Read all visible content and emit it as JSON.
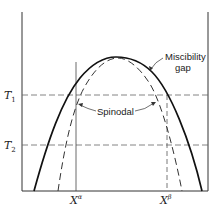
{
  "diagram": {
    "type": "phase-diagram",
    "curves": {
      "miscibility_gap": {
        "label": "Miscibility gap",
        "label_line1": "Miscibility",
        "label_line2": "gap",
        "style": "solid"
      },
      "spinodal": {
        "label": "Spinodal",
        "style": "dashed"
      }
    },
    "temperatures": [
      {
        "id": "T1",
        "label": "T",
        "subscript": "1"
      },
      {
        "id": "T2",
        "label": "T",
        "subscript": "2"
      }
    ],
    "compositions": [
      {
        "id": "X_alpha",
        "label": "X",
        "superscript": "α"
      },
      {
        "id": "X_beta",
        "label": "X",
        "superscript": "β"
      }
    ],
    "colors": {
      "line": "#222222",
      "dashed": "#555555",
      "background": "#ffffff"
    }
  }
}
